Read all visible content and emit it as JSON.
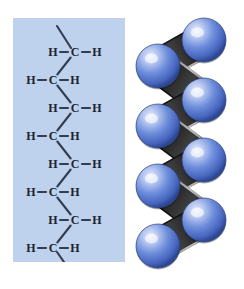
{
  "figure": {
    "background_color": "#ffffff"
  },
  "structural_formula": {
    "panel_color": "#bed2ee",
    "bond_color": "#333d52",
    "atom_text_color": "#1b2330",
    "carbon_symbol": "C",
    "hydrogen_symbol": "H",
    "carbon_count": 8,
    "hydrogen_count": 16,
    "rows": [
      {
        "index": 0,
        "carbon_x": 62,
        "carbon_y": 34,
        "side": "right",
        "left_h": "H",
        "carbon": "C",
        "right_h": "H"
      },
      {
        "index": 1,
        "carbon_x": 40,
        "carbon_y": 62,
        "side": "left",
        "left_h": "H",
        "carbon": "C",
        "right_h": "H"
      },
      {
        "index": 2,
        "carbon_x": 62,
        "carbon_y": 90,
        "side": "right",
        "left_h": "H",
        "carbon": "C",
        "right_h": "H"
      },
      {
        "index": 3,
        "carbon_x": 40,
        "carbon_y": 118,
        "side": "left",
        "left_h": "H",
        "carbon": "C",
        "right_h": "H"
      },
      {
        "index": 4,
        "carbon_x": 62,
        "carbon_y": 146,
        "side": "right",
        "left_h": "H",
        "carbon": "C",
        "right_h": "H"
      },
      {
        "index": 5,
        "carbon_x": 40,
        "carbon_y": 174,
        "side": "left",
        "left_h": "H",
        "carbon": "C",
        "right_h": "H"
      },
      {
        "index": 6,
        "carbon_x": 62,
        "carbon_y": 202,
        "side": "right",
        "left_h": "H",
        "carbon": "C",
        "right_h": "H"
      },
      {
        "index": 7,
        "carbon_x": 40,
        "carbon_y": 230,
        "side": "left",
        "left_h": "H",
        "carbon": "C",
        "right_h": "H"
      }
    ],
    "terminal_bonds": [
      {
        "name": "top-stub",
        "x1": 58,
        "y1": 30,
        "x2": 44,
        "y2": 8
      },
      {
        "name": "bottom-stub",
        "x1": 44,
        "y1": 234,
        "x2": 58,
        "y2": 254
      }
    ]
  },
  "space_filling_model": {
    "sphere_color": "#5b7fd4",
    "sphere_highlight_color": "#dfe8fb",
    "sphere_edge_color": "#2b3f7a",
    "backbone_color": "#141414",
    "backbone_highlight_color": "#6e6e6e",
    "sphere_count": 8,
    "spheres": [
      {
        "index": 0,
        "cx": 76,
        "cy": 32,
        "r": 22,
        "side": "right"
      },
      {
        "index": 1,
        "cx": 30,
        "cy": 58,
        "r": 22,
        "side": "left"
      },
      {
        "index": 2,
        "cx": 76,
        "cy": 92,
        "r": 22,
        "side": "right"
      },
      {
        "index": 3,
        "cx": 30,
        "cy": 118,
        "r": 22,
        "side": "left"
      },
      {
        "index": 4,
        "cx": 76,
        "cy": 152,
        "r": 22,
        "side": "right"
      },
      {
        "index": 5,
        "cx": 30,
        "cy": 178,
        "r": 22,
        "side": "left"
      },
      {
        "index": 6,
        "cx": 76,
        "cy": 212,
        "r": 22,
        "side": "right"
      },
      {
        "index": 7,
        "cx": 30,
        "cy": 238,
        "r": 22,
        "side": "left"
      }
    ]
  }
}
